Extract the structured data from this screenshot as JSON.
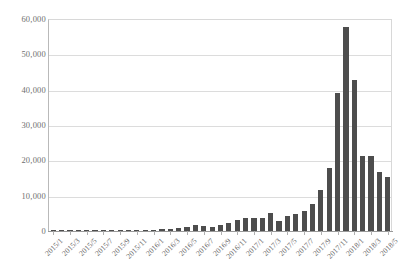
{
  "chart_data": {
    "type": "bar",
    "title": "",
    "subtitle": "",
    "xlabel": "",
    "ylabel": "",
    "ylim": [
      0,
      60000
    ],
    "ytick_values": [
      0,
      10000,
      20000,
      30000,
      40000,
      50000,
      60000
    ],
    "ytick_labels": [
      "0",
      "10,000",
      "20,000",
      "30,000",
      "40,000",
      "50,000",
      "60,000"
    ],
    "grid": true,
    "legend": "none",
    "bar_color": "#4d4d4d",
    "gridline_color": "#dcdcdc",
    "axis_color": "#9a9a9a",
    "label_color": "#666666",
    "xtick_label_rotation": -45,
    "xtick_label_interval": 2,
    "categories": [
      "2015/1",
      "2015/2",
      "2015/3",
      "2015/4",
      "2015/5",
      "2015/6",
      "2015/7",
      "2015/8",
      "2015/9",
      "2015/10",
      "2015/11",
      "2015/12",
      "2016/1",
      "2016/2",
      "2016/3",
      "2016/4",
      "2016/5",
      "2016/6",
      "2016/7",
      "2016/8",
      "2016/9",
      "2016/10",
      "2016/11",
      "2016/12",
      "2017/1",
      "2017/2",
      "2017/3",
      "2017/4",
      "2017/5",
      "2017/6",
      "2017/7",
      "2017/8",
      "2017/9",
      "2017/10",
      "2017/11",
      "2017/12",
      "2018/1",
      "2018/2",
      "2018/3",
      "2018/4",
      "2018/5"
    ],
    "visible_xtick_labels": [
      "2015/1",
      "2015/3",
      "2015/5",
      "2015/7",
      "2015/9",
      "2015/11",
      "2016/1",
      "2016/3",
      "2016/5",
      "2016/7",
      "2016/9",
      "2016/11",
      "2017/1",
      "2017/3",
      "2017/5",
      "2017/7",
      "2017/9",
      "2017/11",
      "2018/1",
      "2018/3",
      "2018/5"
    ],
    "values": [
      30,
      40,
      50,
      60,
      70,
      80,
      90,
      110,
      130,
      170,
      220,
      300,
      400,
      520,
      640,
      900,
      1200,
      1600,
      1500,
      1200,
      1600,
      2200,
      3000,
      3800,
      3700,
      3600,
      5000,
      2700,
      4200,
      4700,
      5700,
      7700,
      11500,
      17700,
      39100,
      57600,
      42600,
      21100,
      21100,
      16700,
      15300
    ]
  }
}
